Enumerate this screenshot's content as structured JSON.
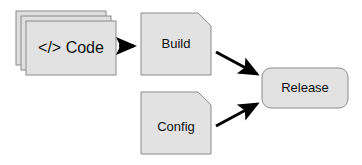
{
  "diagram": {
    "type": "flowchart",
    "background_color": "#ffffff",
    "node_fill": "#e2e2e2",
    "node_fill_back": "#dedede",
    "node_stroke": "#8a8a8a",
    "arrow_color": "#000000",
    "text_color": "#111111",
    "nodes": [
      {
        "id": "code",
        "label": "</> Code",
        "shape": "stacked-rectangle",
        "stack_count": 3,
        "x": 26,
        "y": 21,
        "width": 90,
        "height": 54
      },
      {
        "id": "build",
        "label": "Build",
        "shape": "document-folded-corner",
        "x": 141,
        "y": 13,
        "width": 70,
        "height": 62
      },
      {
        "id": "config",
        "label": "Config",
        "shape": "document-folded-corner",
        "x": 141,
        "y": 92,
        "width": 70,
        "height": 62
      },
      {
        "id": "release",
        "label": "Release",
        "shape": "rounded-rectangle",
        "x": 262,
        "y": 68,
        "width": 86,
        "height": 40
      }
    ],
    "edges": [
      {
        "id": "code-to-build",
        "from": "code",
        "to": "build",
        "label": "",
        "direction": "right"
      },
      {
        "id": "build-to-release",
        "from": "build",
        "to": "release",
        "label": "",
        "direction": "down-right"
      },
      {
        "id": "config-to-release",
        "from": "config",
        "to": "release",
        "label": "",
        "direction": "up-right"
      }
    ]
  }
}
